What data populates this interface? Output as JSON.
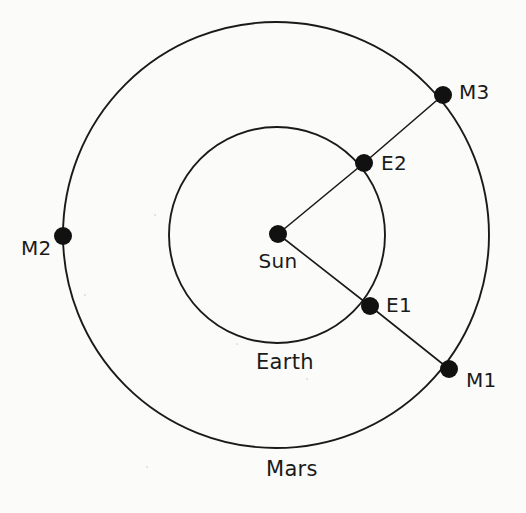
{
  "figure": {
    "type": "orbital-diagram",
    "background_color": "#fbfbf9",
    "stroke_color": "#1a1a1a",
    "marker_color": "#111111"
  },
  "chart_data": {
    "type": "scatter",
    "title": "",
    "xlabel": "",
    "ylabel": "",
    "center": {
      "name": "Sun",
      "x": 278,
      "y": 234
    },
    "orbits": [
      {
        "name": "Earth",
        "cx": 277,
        "cy": 235,
        "r": 108,
        "label": "Earth",
        "label_x": 285,
        "label_y": 363
      },
      {
        "name": "Mars",
        "cx": 276,
        "cy": 235,
        "r": 213,
        "label": "Mars",
        "label_x": 292,
        "label_y": 470
      }
    ],
    "points": [
      {
        "id": "sun",
        "label": "Sun",
        "x": 278,
        "y": 234,
        "r": 9,
        "label_x": 278,
        "label_y": 262,
        "label_anchor": "middle"
      },
      {
        "id": "e1",
        "label": "E1",
        "x": 370,
        "y": 306,
        "r": 9,
        "label_x": 386,
        "label_y": 306,
        "label_anchor": "start"
      },
      {
        "id": "e2",
        "label": "E2",
        "x": 364,
        "y": 163,
        "r": 9,
        "label_x": 381,
        "label_y": 164,
        "label_anchor": "start"
      },
      {
        "id": "m1",
        "label": "M1",
        "x": 449,
        "y": 369,
        "r": 9,
        "label_x": 466,
        "label_y": 381,
        "label_anchor": "start"
      },
      {
        "id": "m2",
        "label": "M2",
        "x": 63,
        "y": 236,
        "r": 9,
        "label_x": 52,
        "label_y": 249,
        "label_anchor": "end"
      },
      {
        "id": "m3",
        "label": "M3",
        "x": 443,
        "y": 95,
        "r": 9,
        "label_x": 459,
        "label_y": 93,
        "label_anchor": "start"
      }
    ],
    "sight_lines": [
      {
        "id": "sun-e1-m1",
        "from": "sun",
        "via": "e1",
        "to": "m1"
      },
      {
        "id": "sun-e2-m3",
        "from": "sun",
        "via": "e2",
        "to": "m3"
      }
    ]
  },
  "labels": {
    "sun": "Sun",
    "earth": "Earth",
    "mars": "Mars",
    "e1": "E1",
    "e2": "E2",
    "m1": "M1",
    "m2": "M2",
    "m3": "M3"
  }
}
